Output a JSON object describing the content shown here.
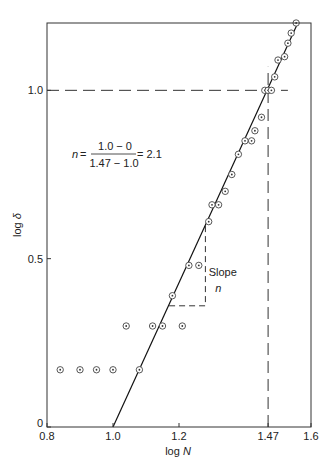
{
  "chart_data": {
    "type": "scatter",
    "title": "",
    "xlabel": "log N",
    "xlabel_parts": {
      "prefix": "log ",
      "var": "N"
    },
    "ylabel": "log δ",
    "ylabel_parts": {
      "prefix": "log ",
      "var": "δ"
    },
    "xlim": [
      0.8,
      1.6
    ],
    "ylim": [
      0,
      1.2
    ],
    "grid": false,
    "legend": null,
    "x_ticks": [
      {
        "value": 0.8,
        "label": "0.8"
      },
      {
        "value": 1.0,
        "label": "1.0"
      },
      {
        "value": 1.2,
        "label": "1.2"
      },
      {
        "value": 1.47,
        "label": "1.47"
      },
      {
        "value": 1.6,
        "label": "1.6"
      }
    ],
    "y_ticks": [
      {
        "value": 0,
        "label": "0"
      },
      {
        "value": 0.5,
        "label": "0.5"
      },
      {
        "value": 1.0,
        "label": "1.0"
      }
    ],
    "series": [
      {
        "name": "data",
        "marker": "circled-dot",
        "points": [
          [
            0.84,
            0.17
          ],
          [
            0.9,
            0.17
          ],
          [
            0.95,
            0.17
          ],
          [
            1.0,
            0.17
          ],
          [
            1.08,
            0.17
          ],
          [
            1.04,
            0.3
          ],
          [
            1.12,
            0.3
          ],
          [
            1.15,
            0.3
          ],
          [
            1.21,
            0.3
          ],
          [
            1.18,
            0.39
          ],
          [
            1.23,
            0.48
          ],
          [
            1.26,
            0.48
          ],
          [
            1.29,
            0.61
          ],
          [
            1.3,
            0.66
          ],
          [
            1.32,
            0.66
          ],
          [
            1.34,
            0.7
          ],
          [
            1.36,
            0.75
          ],
          [
            1.38,
            0.81
          ],
          [
            1.4,
            0.85
          ],
          [
            1.42,
            0.85
          ],
          [
            1.43,
            0.88
          ],
          [
            1.45,
            0.92
          ],
          [
            1.46,
            1.0
          ],
          [
            1.47,
            1.0
          ],
          [
            1.48,
            1.0
          ],
          [
            1.49,
            1.04
          ],
          [
            1.5,
            1.09
          ],
          [
            1.52,
            1.1
          ],
          [
            1.53,
            1.14
          ],
          [
            1.54,
            1.17
          ],
          [
            1.555,
            1.2
          ]
        ]
      }
    ],
    "fit_line": {
      "name": "fit",
      "x0": 1.0,
      "y0": 0.0,
      "x1": 1.56,
      "y1": 1.2,
      "slope": 2.1
    },
    "reference_lines": [
      {
        "orientation": "horizontal",
        "y": 1.0,
        "x_from": 0.8,
        "x_to": 1.53,
        "style": "dashed"
      },
      {
        "orientation": "vertical",
        "x": 1.47,
        "y_from": 0,
        "y_to": 1.07,
        "style": "dashed"
      }
    ],
    "slope_triangle": {
      "x_left": 1.17,
      "x_right": 1.28,
      "y_bottom": 0.36,
      "y_top": 0.6,
      "style": "dashed"
    },
    "annotations": [
      {
        "text": "Slope",
        "x": 1.29,
        "y": 0.45
      },
      {
        "text": "n",
        "x": 1.31,
        "y": 0.4,
        "italic": true
      }
    ],
    "formula": {
      "lhs_var": "n",
      "equals": "=",
      "numerator": "1.0 − 0",
      "denominator": "1.47 − 1.0",
      "result": "= 2.1"
    }
  }
}
